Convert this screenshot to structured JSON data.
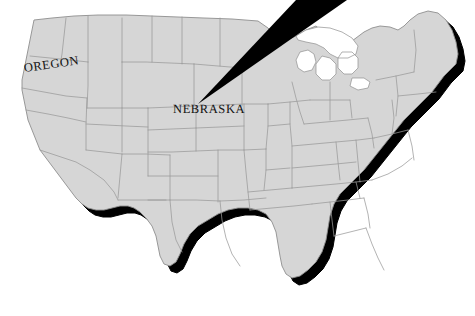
{
  "figure": {
    "type": "map",
    "region": "United States (contiguous 48 states)",
    "background_color": "#ffffff",
    "land_fill_color": "#d6d6d6",
    "border_stroke_color": "#9a9a9a",
    "shadow_color": "#000000",
    "label_color": "#111111",
    "width": 475,
    "height": 316
  },
  "labels": [
    {
      "id": "oregon",
      "text": "OREGON",
      "x": 24,
      "y": 61,
      "rotation_deg": -8,
      "font_size": 12.5
    },
    {
      "id": "nebraska",
      "text": "NEBRASKA",
      "x": 173,
      "y": 102,
      "rotation_deg": 0,
      "font_size": 12.5
    }
  ],
  "pointer": {
    "name": "nebraska-pointer-wedge",
    "color": "#000000",
    "tip_x": 198,
    "tip_y": 104,
    "base_left_x": 296,
    "base_left_y": 0,
    "base_right_x": 347,
    "base_right_y": 0,
    "description": "Black triangular pointer from top edge down-left to the Nebraska label"
  },
  "map_features": {
    "lakes_visible": true,
    "state_borders_visible": true,
    "drop_shadow_offset_x": 7,
    "drop_shadow_offset_y": 7
  }
}
